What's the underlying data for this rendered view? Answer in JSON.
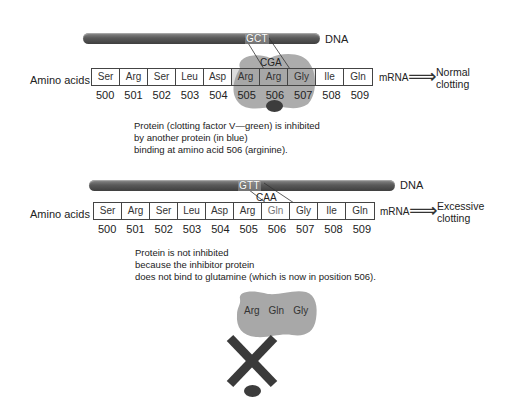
{
  "panel_normal": {
    "dna_label": "DNA",
    "dna_codon": "GCT",
    "mrna_codon": "CGA",
    "row_label": "Amino acids",
    "amino_acids": [
      "Ser",
      "Arg",
      "Ser",
      "Leu",
      "Asp",
      "Arg",
      "Arg",
      "Gly",
      "Ile",
      "Gln"
    ],
    "positions": [
      "500",
      "501",
      "502",
      "503",
      "504",
      "505",
      "506",
      "507",
      "508",
      "509"
    ],
    "mrna_label": "mRNA",
    "outcome_line1": "Normal",
    "outcome_line2": "clotting",
    "caption_lines": [
      "Protein (clotting factor V—green) is inhibited",
      "by another protein (in blue)",
      "binding at amino acid 506 (arginine)."
    ]
  },
  "panel_mutant": {
    "dna_label": "DNA",
    "dna_codon": "GTT",
    "mrna_codon": "CAA",
    "row_label": "Amino acids",
    "amino_acids": [
      "Ser",
      "Arg",
      "Ser",
      "Leu",
      "Asp",
      "Arg",
      "Gln",
      "Gly",
      "Ile",
      "Gln"
    ],
    "positions": [
      "500",
      "501",
      "502",
      "503",
      "504",
      "505",
      "506",
      "507",
      "508",
      "509"
    ],
    "mrna_label": "mRNA",
    "outcome_line1": "Excessive",
    "outcome_line2": "clotting",
    "caption_lines": [
      "Protein is not inhibited",
      "because the inhibitor protein",
      "does not bind to glutamine (which is now in position 506)."
    ]
  },
  "protein_fragment": {
    "residues": [
      "Arg",
      "Gln",
      "Gly"
    ]
  },
  "icons": {
    "arrow": "⟹",
    "block": "x-mark"
  },
  "colors": {
    "dna": "#5a5a5a",
    "protein_factor_v": "#9a9a9a",
    "inhibitor": "#3c3c3c",
    "x_mark": "#3a3a3a"
  }
}
